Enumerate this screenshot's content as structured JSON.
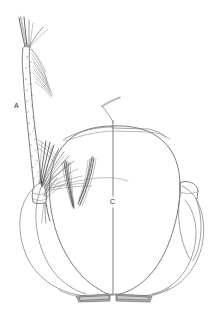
{
  "figure": {
    "medium": "ink line drawing",
    "background_color": "#ffffff",
    "ink_color": "#4a4a4a",
    "outline_color": "#5d5d5d",
    "canvas": {
      "width": 224,
      "height": 315
    },
    "labels": [
      {
        "id": "label-a",
        "text": "A",
        "x": 14,
        "y": 108,
        "points_to": "antenna shaft"
      },
      {
        "id": "label-c",
        "text": "C",
        "x": 112,
        "y": 202,
        "points_to": "head capsule midline"
      }
    ],
    "parts": [
      {
        "name": "antenna",
        "label": "A"
      },
      {
        "name": "antennal-seta-tuft",
        "label": ""
      },
      {
        "name": "head-capsule",
        "label": "C"
      },
      {
        "name": "frontal-setae",
        "label": ""
      },
      {
        "name": "maxillary-palp",
        "label": ""
      },
      {
        "name": "mouthbrush-plates",
        "label": ""
      }
    ]
  }
}
